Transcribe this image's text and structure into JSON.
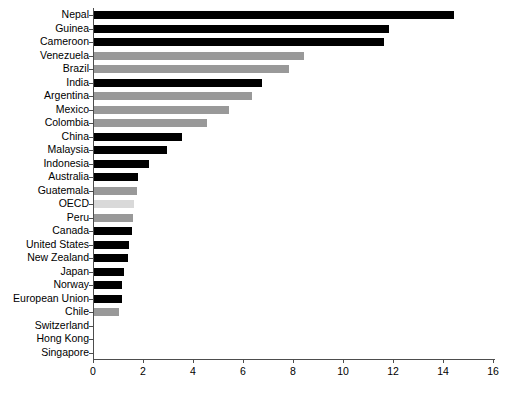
{
  "chart_data": {
    "type": "bar",
    "orientation": "horizontal",
    "title": "",
    "xlabel": "",
    "ylabel": "",
    "xlim": [
      0,
      16
    ],
    "ylim": null,
    "xticks": [
      0,
      2,
      4,
      6,
      8,
      10,
      12,
      14,
      16
    ],
    "xtick_labels": [
      "0",
      "2",
      "4",
      "6",
      "8",
      "10",
      "12",
      "14",
      "16"
    ],
    "grid": false,
    "legend": null,
    "categories": [
      "Nepal",
      "Guinea",
      "Cameroon",
      "Venezuela",
      "Brazil",
      "India",
      "Argentina",
      "Mexico",
      "Colombia",
      "China",
      "Malaysia",
      "Indonesia",
      "Australia",
      "Guatemala",
      "OECD",
      "Peru",
      "Canada",
      "United States",
      "New Zealand",
      "Japan",
      "Norway",
      "European Union",
      "Chile",
      "Switzerland",
      "Hong Kong",
      "Singapore"
    ],
    "values": [
      14.4,
      11.8,
      11.6,
      8.4,
      7.8,
      6.7,
      6.3,
      5.4,
      4.5,
      3.5,
      2.9,
      2.2,
      1.75,
      1.7,
      1.6,
      1.55,
      1.5,
      1.4,
      1.35,
      1.2,
      1.1,
      1.1,
      1.0,
      0.0,
      0.0,
      0.0
    ],
    "bar_colors": [
      "dark",
      "dark",
      "dark",
      "gray",
      "gray",
      "dark",
      "gray",
      "gray",
      "gray",
      "dark",
      "dark",
      "dark",
      "dark",
      "gray",
      "light",
      "gray",
      "dark",
      "dark",
      "dark",
      "dark",
      "dark",
      "dark",
      "gray",
      "dark",
      "dark",
      "dark"
    ]
  },
  "colors": {
    "dark": "#000000",
    "gray": "#999999",
    "light": "#d9d9d9",
    "axis": "#4d4d4d",
    "background": "#ffffff"
  }
}
